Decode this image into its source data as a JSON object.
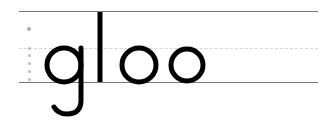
{
  "worksheet": {
    "word": "gloo",
    "letters": [
      "g",
      "l",
      "o",
      "o"
    ],
    "lines": [
      "top-line",
      "midline-dashed",
      "baseline"
    ],
    "colors": {
      "ink": "#000000",
      "rule": "#777777",
      "midline": "#d6d6d6",
      "guide_dots": "#bcbcbc"
    }
  }
}
